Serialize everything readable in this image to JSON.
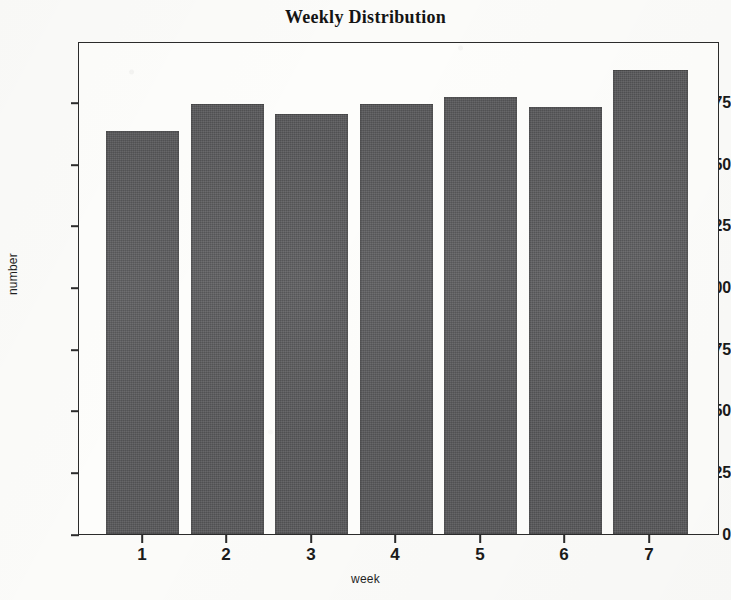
{
  "chart_data": {
    "type": "bar",
    "title": "Weekly Distribution",
    "xlabel": "week",
    "ylabel": "number",
    "categories": [
      "1",
      "2",
      "3",
      "4",
      "5",
      "6",
      "7"
    ],
    "values": [
      164,
      175,
      171,
      175,
      178,
      174,
      189
    ],
    "ylim": [
      0,
      200
    ],
    "yticks": [
      0,
      25,
      50,
      75,
      100,
      125,
      150,
      175
    ],
    "ytick_labels": [
      "0",
      "25",
      "50",
      "75",
      "100",
      "125",
      "150",
      "175"
    ],
    "xtick_labels": [
      "1",
      "2",
      "3",
      "4",
      "5",
      "6",
      "7"
    ],
    "grid": false,
    "legend": null,
    "series": [
      {
        "name": "number",
        "values": [
          164,
          175,
          171,
          175,
          178,
          174,
          189
        ]
      }
    ],
    "colors": {
      "bar_fill": "#58585a",
      "axis": "#2b2b2b",
      "text": "#1a1a1a",
      "background": "#fbfbf9"
    }
  }
}
